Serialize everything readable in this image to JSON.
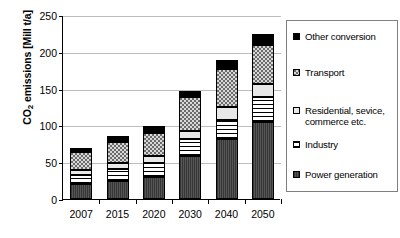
{
  "chart_data": {
    "type": "bar",
    "subtype": "stacked-vertical",
    "title": "",
    "xlabel": "",
    "ylabel": "CO2 emissions [Mill t/a]",
    "ylabel_parts": {
      "prefix": "CO",
      "sub": "2",
      "suffix": " emissions [Mill t/a]"
    },
    "categories": [
      "2007",
      "2015",
      "2020",
      "2030",
      "2040",
      "2050"
    ],
    "ylim": [
      0,
      250
    ],
    "yticks": [
      0,
      50,
      100,
      150,
      200,
      250
    ],
    "ytick_labels": [
      "0",
      "50",
      "100",
      "150",
      "200",
      "250"
    ],
    "grid": "horizontal",
    "legend_position": "right-outside",
    "series": [
      {
        "name": "Power generation",
        "fill": "fill-power",
        "values": [
          20,
          25,
          30,
          59,
          82,
          104
        ]
      },
      {
        "name": "Industry",
        "fill": "fill-industry",
        "values": [
          13,
          16,
          19,
          22,
          26,
          34
        ]
      },
      {
        "name": "Residential, sevice, commerce etc.",
        "fill": "fill-residential",
        "values": [
          7,
          8,
          9,
          11,
          17,
          18
        ]
      },
      {
        "name": "Transport",
        "fill": "fill-transport",
        "values": [
          24,
          28,
          32,
          46,
          51,
          53
        ]
      },
      {
        "name": "Other conversion",
        "fill": "fill-other",
        "values": [
          5,
          8,
          9,
          9,
          13,
          15
        ]
      }
    ],
    "totals": [
      69,
      85,
      99,
      147,
      189,
      224
    ]
  },
  "legend": {
    "items": [
      {
        "label": "Other conversion",
        "marker": "solid-black-square",
        "series": "Other conversion"
      },
      {
        "label": "Transport",
        "marker": "checkered-gray-square",
        "series": "Transport"
      },
      {
        "label": "Residential, sevice, commerce etc.",
        "marker": "white-square",
        "series": "Residential, sevice, commerce etc."
      },
      {
        "label": "Industry",
        "marker": "light-hatched-square",
        "series": "Industry"
      },
      {
        "label": "Power generation",
        "marker": "dark-gray-square",
        "series": "Power generation"
      }
    ]
  }
}
